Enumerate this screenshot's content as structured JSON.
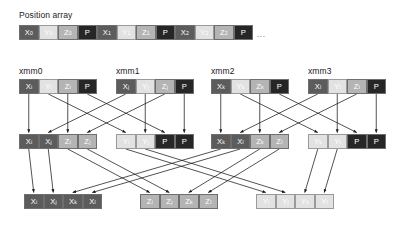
{
  "labels": {
    "position_array": "Position array",
    "xmm0": "xmm0",
    "xmm1": "xmm1",
    "xmm2": "xmm2",
    "xmm3": "xmm3",
    "ellipsis": "..."
  },
  "colors": {
    "x": "#5c5c5c",
    "y": "#e2e2e2",
    "z": "#b4b4b4",
    "p": "#262626",
    "background": "#ffffff",
    "arrow": "#1a1a1a",
    "text": "#1a1a1a"
  },
  "position_array": {
    "cells": [
      {
        "base": "X",
        "sub": "0",
        "kind": "x"
      },
      {
        "base": "Y",
        "sub": "0",
        "kind": "y"
      },
      {
        "base": "Z",
        "sub": "0",
        "kind": "z"
      },
      {
        "base": "P",
        "sub": "",
        "kind": "p"
      },
      {
        "base": "X",
        "sub": "1",
        "kind": "x"
      },
      {
        "base": "Y",
        "sub": "1",
        "kind": "y"
      },
      {
        "base": "Z",
        "sub": "1",
        "kind": "z"
      },
      {
        "base": "P",
        "sub": "",
        "kind": "p"
      },
      {
        "base": "X",
        "sub": "2",
        "kind": "x"
      },
      {
        "base": "Y",
        "sub": "2",
        "kind": "y"
      },
      {
        "base": "Z",
        "sub": "2",
        "kind": "z"
      },
      {
        "base": "P",
        "sub": "",
        "kind": "p"
      }
    ]
  },
  "registers_row": [
    {
      "name": "xmm0",
      "cells": [
        {
          "base": "X",
          "sub": "i",
          "kind": "x"
        },
        {
          "base": "Y",
          "sub": "i",
          "kind": "y"
        },
        {
          "base": "Z",
          "sub": "i",
          "kind": "z"
        },
        {
          "base": "P",
          "sub": "",
          "kind": "p"
        }
      ]
    },
    {
      "name": "xmm1",
      "cells": [
        {
          "base": "X",
          "sub": "j",
          "kind": "x"
        },
        {
          "base": "Y",
          "sub": "j",
          "kind": "y"
        },
        {
          "base": "Z",
          "sub": "j",
          "kind": "z"
        },
        {
          "base": "P",
          "sub": "",
          "kind": "p"
        }
      ]
    },
    {
      "name": "xmm2",
      "cells": [
        {
          "base": "X",
          "sub": "k",
          "kind": "x"
        },
        {
          "base": "Y",
          "sub": "k",
          "kind": "y"
        },
        {
          "base": "Z",
          "sub": "k",
          "kind": "z"
        },
        {
          "base": "P",
          "sub": "",
          "kind": "p"
        }
      ]
    },
    {
      "name": "xmm3",
      "cells": [
        {
          "base": "X",
          "sub": "l",
          "kind": "x"
        },
        {
          "base": "Y",
          "sub": "l",
          "kind": "y"
        },
        {
          "base": "Z",
          "sub": "l",
          "kind": "z"
        },
        {
          "base": "P",
          "sub": "",
          "kind": "p"
        }
      ]
    }
  ],
  "middle_row": [
    {
      "cells": [
        {
          "base": "X",
          "sub": "i",
          "kind": "x"
        },
        {
          "base": "X",
          "sub": "j",
          "kind": "x"
        },
        {
          "base": "Z",
          "sub": "i",
          "kind": "z"
        },
        {
          "base": "Z",
          "sub": "j",
          "kind": "z"
        }
      ]
    },
    {
      "cells": [
        {
          "base": "Y",
          "sub": "i",
          "kind": "y"
        },
        {
          "base": "Y",
          "sub": "j",
          "kind": "y"
        },
        {
          "base": "P",
          "sub": "",
          "kind": "p"
        },
        {
          "base": "P",
          "sub": "",
          "kind": "p"
        }
      ]
    },
    {
      "cells": [
        {
          "base": "X",
          "sub": "k",
          "kind": "x"
        },
        {
          "base": "X",
          "sub": "l",
          "kind": "x"
        },
        {
          "base": "Z",
          "sub": "k",
          "kind": "z"
        },
        {
          "base": "Z",
          "sub": "l",
          "kind": "z"
        }
      ]
    },
    {
      "cells": [
        {
          "base": "Y",
          "sub": "k",
          "kind": "y"
        },
        {
          "base": "Y",
          "sub": "l",
          "kind": "y"
        },
        {
          "base": "P",
          "sub": "",
          "kind": "p"
        },
        {
          "base": "P",
          "sub": "",
          "kind": "p"
        }
      ]
    }
  ],
  "bottom_row": [
    {
      "cells": [
        {
          "base": "X",
          "sub": "i",
          "kind": "x"
        },
        {
          "base": "X",
          "sub": "j",
          "kind": "x"
        },
        {
          "base": "X",
          "sub": "k",
          "kind": "x"
        },
        {
          "base": "X",
          "sub": "l",
          "kind": "x"
        }
      ]
    },
    {
      "cells": [
        {
          "base": "Z",
          "sub": "i",
          "kind": "z"
        },
        {
          "base": "Z",
          "sub": "j",
          "kind": "z"
        },
        {
          "base": "Z",
          "sub": "k",
          "kind": "z"
        },
        {
          "base": "Z",
          "sub": "l",
          "kind": "z"
        }
      ]
    },
    {
      "cells": [
        {
          "base": "Y",
          "sub": "i",
          "kind": "y"
        },
        {
          "base": "Y",
          "sub": "j",
          "kind": "y"
        },
        {
          "base": "Y",
          "sub": "k",
          "kind": "y"
        },
        {
          "base": "Y",
          "sub": "l",
          "kind": "y"
        }
      ]
    }
  ],
  "geometry": {
    "cell_w": 19.5,
    "cell_h": 15,
    "pos_array": {
      "x": 19,
      "y": 25
    },
    "row1_y": 79,
    "row2_y": 134,
    "row3_y": 194,
    "group_x": [
      19,
      116,
      211,
      308
    ],
    "bottom_group_x": [
      24,
      140,
      256
    ],
    "label_y_row1": 66
  }
}
